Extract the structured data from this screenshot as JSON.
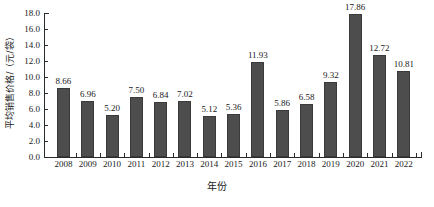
{
  "chart_data": {
    "type": "bar",
    "title": "",
    "xlabel": "年份",
    "ylabel": "平均销售价格/（元/袋）",
    "categories": [
      "2008",
      "2009",
      "2010",
      "2011",
      "2012",
      "2013",
      "2014",
      "2015",
      "2016",
      "2017",
      "2018",
      "2019",
      "2020",
      "2021",
      "2022"
    ],
    "values": [
      8.66,
      6.96,
      5.2,
      7.5,
      6.84,
      7.02,
      5.12,
      5.36,
      11.93,
      5.86,
      6.58,
      9.32,
      17.86,
      12.72,
      10.81
    ],
    "value_labels": [
      "8.66",
      "6.96",
      "5.20",
      "7.50",
      "6.84",
      "7.02",
      "5.12",
      "5.36",
      "11.93",
      "5.86",
      "6.58",
      "9.32",
      "17.86",
      "12.72",
      "10.81"
    ],
    "ylim": [
      0.0,
      18.0
    ],
    "ytick_labels": [
      "0.0",
      "2.0",
      "4.0",
      "6.0",
      "8.0",
      "10.0",
      "12.0",
      "14.0",
      "16.0",
      "18.0"
    ],
    "ytick_values": [
      0.0,
      2.0,
      4.0,
      6.0,
      8.0,
      10.0,
      12.0,
      14.0,
      16.0,
      18.0
    ],
    "grid": false,
    "legend": null,
    "series_color": "#4d4d4d",
    "axis_color": "#2b2b2b"
  }
}
